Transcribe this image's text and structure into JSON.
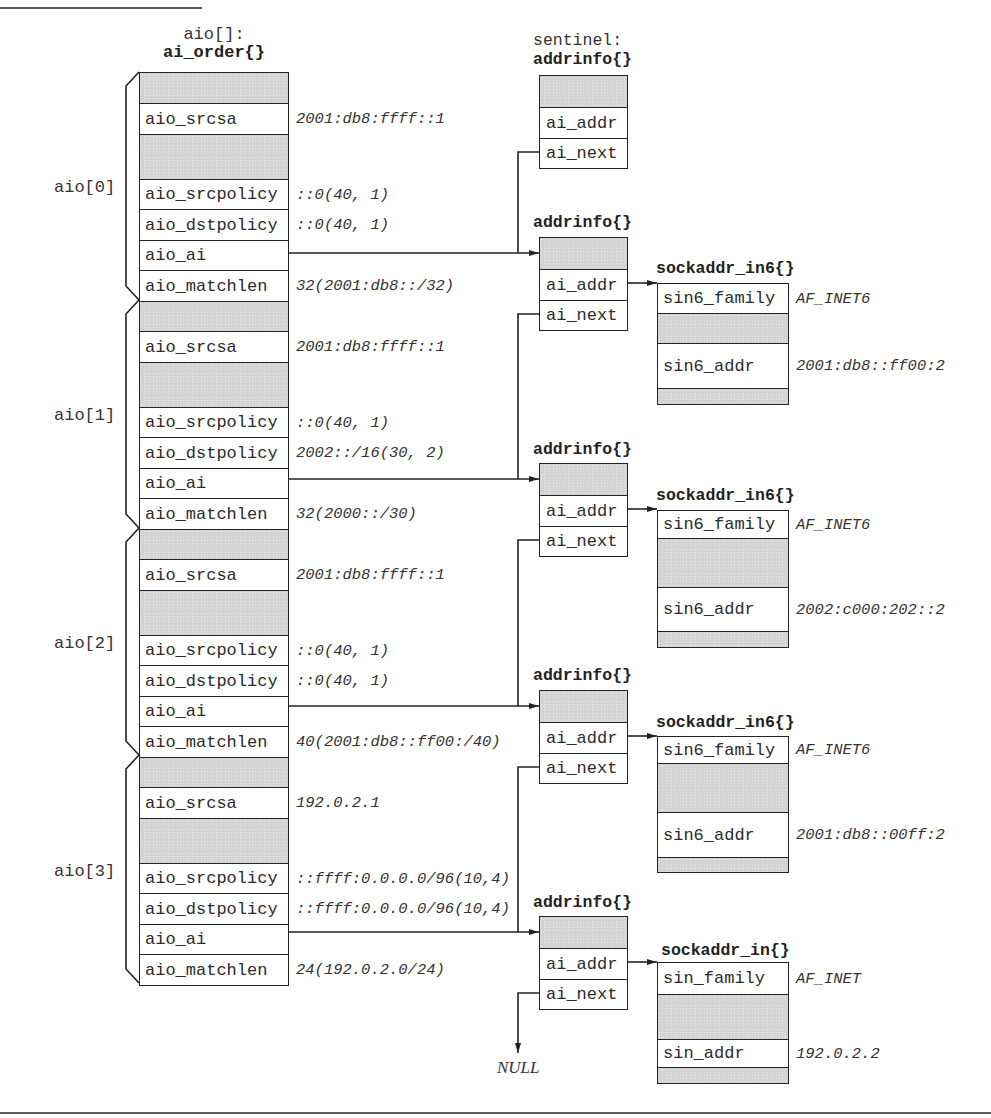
{
  "figure": {
    "aio_array_label": "aio[]:",
    "aio_struct_name": "ai_order{}",
    "null_label": "NULL"
  },
  "aio": [
    {
      "index_label": "aio[0]",
      "srcsa": {
        "name": "aio_srcsa",
        "value": "2001:db8:ffff::1"
      },
      "srcpolicy": {
        "name": "aio_srcpolicy",
        "value": "::0(40, 1)"
      },
      "dstpolicy": {
        "name": "aio_dstpolicy",
        "value": "::0(40, 1)"
      },
      "ai": {
        "name": "aio_ai"
      },
      "matchlen": {
        "name": "aio_matchlen",
        "value": "32(2001:db8::/32)"
      }
    },
    {
      "index_label": "aio[1]",
      "srcsa": {
        "name": "aio_srcsa",
        "value": "2001:db8:ffff::1"
      },
      "srcpolicy": {
        "name": "aio_srcpolicy",
        "value": "::0(40, 1)"
      },
      "dstpolicy": {
        "name": "aio_dstpolicy",
        "value": "2002::/16(30, 2)"
      },
      "ai": {
        "name": "aio_ai"
      },
      "matchlen": {
        "name": "aio_matchlen",
        "value": "32(2000::/30)"
      }
    },
    {
      "index_label": "aio[2]",
      "srcsa": {
        "name": "aio_srcsa",
        "value": "2001:db8:ffff::1"
      },
      "srcpolicy": {
        "name": "aio_srcpolicy",
        "value": "::0(40, 1)"
      },
      "dstpolicy": {
        "name": "aio_dstpolicy",
        "value": "::0(40, 1)"
      },
      "ai": {
        "name": "aio_ai"
      },
      "matchlen": {
        "name": "aio_matchlen",
        "value": "40(2001:db8::ff00:/40)"
      }
    },
    {
      "index_label": "aio[3]",
      "srcsa": {
        "name": "aio_srcsa",
        "value": "192.0.2.1"
      },
      "srcpolicy": {
        "name": "aio_srcpolicy",
        "value": "::ffff:0.0.0.0/96(10,4)"
      },
      "dstpolicy": {
        "name": "aio_dstpolicy",
        "value": "::ffff:0.0.0.0/96(10,4)"
      },
      "ai": {
        "name": "aio_ai"
      },
      "matchlen": {
        "name": "aio_matchlen",
        "value": "24(192.0.2.0/24)"
      }
    }
  ],
  "sentinel": {
    "label": "sentinel:",
    "title": "addrinfo{}",
    "addr_field": "ai_addr",
    "next_field": "ai_next"
  },
  "addrinfo": [
    {
      "title": "addrinfo{}",
      "addr_field": "ai_addr",
      "next_field": "ai_next",
      "sockaddr": {
        "title": "sockaddr_in6{}",
        "family_field": "sin6_family",
        "family_value": "AF_INET6",
        "addr_field": "sin6_addr",
        "addr_value": "2001:db8::ff00:2"
      }
    },
    {
      "title": "addrinfo{}",
      "addr_field": "ai_addr",
      "next_field": "ai_next",
      "sockaddr": {
        "title": "sockaddr_in6{}",
        "family_field": "sin6_family",
        "family_value": "AF_INET6",
        "addr_field": "sin6_addr",
        "addr_value": "2002:c000:202::2"
      }
    },
    {
      "title": "addrinfo{}",
      "addr_field": "ai_addr",
      "next_field": "ai_next",
      "sockaddr": {
        "title": "sockaddr_in6{}",
        "family_field": "sin6_family",
        "family_value": "AF_INET6",
        "addr_field": "sin6_addr",
        "addr_value": "2001:db8::00ff:2"
      }
    },
    {
      "title": "addrinfo{}",
      "addr_field": "ai_addr",
      "next_field": "ai_next",
      "sockaddr": {
        "title": "sockaddr_in{}",
        "family_field": "sin_family",
        "family_value": "AF_INET",
        "addr_field": "sin_addr",
        "addr_value": "192.0.2.2"
      }
    }
  ]
}
